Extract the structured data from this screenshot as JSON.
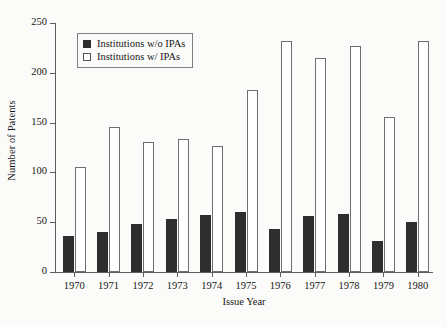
{
  "chart_data": {
    "type": "bar",
    "title": "",
    "xlabel": "Issue Year",
    "ylabel": "Number of Patents",
    "categories": [
      "1970",
      "1971",
      "1972",
      "1973",
      "1974",
      "1975",
      "1976",
      "1977",
      "1978",
      "1979",
      "1980"
    ],
    "series": [
      {
        "name": "Institutions w/o IPAs",
        "color": "#2e2e2e",
        "style": "filled",
        "values": [
          36,
          40,
          48,
          53,
          57,
          60,
          43,
          56,
          58,
          31,
          50
        ]
      },
      {
        "name": "Institutions w/ IPAs",
        "color": "#ffffff",
        "style": "open",
        "values": [
          105,
          146,
          131,
          134,
          127,
          183,
          232,
          215,
          227,
          156,
          232
        ]
      }
    ],
    "ylim": [
      0,
      250
    ],
    "yticks": [
      0,
      50,
      100,
      150,
      200,
      250
    ],
    "ytick_labels": [
      "0",
      "50",
      "100",
      "150",
      "200",
      "250"
    ],
    "grid": false,
    "legend_position": "upper-left",
    "legend_entries": [
      "Institutions w/o IPAs",
      "Institutions w/ IPAs"
    ]
  },
  "legend": {
    "items": [
      {
        "label": "Institutions w/o IPAs",
        "swatch": "filled-square-icon"
      },
      {
        "label": "Institutions w/ IPAs",
        "swatch": "open-square-icon"
      }
    ]
  }
}
